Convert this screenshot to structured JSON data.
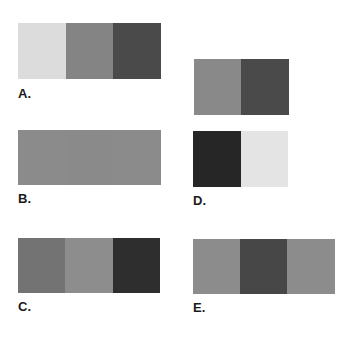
{
  "figures": {
    "A": {
      "label": "A.",
      "colors": [
        "#dcdcdc",
        "#848484",
        "#4a4a4a"
      ]
    },
    "B": {
      "label": "B.",
      "colors": [
        "#8b8b8b",
        "#8a8a8a",
        "#8b8b8b"
      ]
    },
    "C": {
      "label": "C.",
      "colors": [
        "#737373",
        "#8d8d8d",
        "#2e2e2e"
      ]
    },
    "D": {
      "label": "D.",
      "top_colors": [
        "#898989",
        "#4a4a4a"
      ],
      "bottom_colors": [
        "#262626",
        "#e4e4e4"
      ]
    },
    "E": {
      "label": "E.",
      "colors": [
        "#8c8c8c",
        "#474747",
        "#8c8c8c"
      ]
    }
  }
}
